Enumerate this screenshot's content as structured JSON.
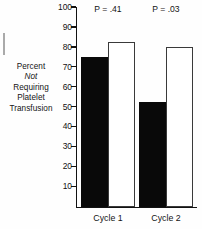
{
  "chart_data": {
    "type": "bar",
    "title": "",
    "xlabel": "",
    "ylabel": "Percent Not Requiring Platelet Transfusion",
    "ylabel_lines": [
      "Percent",
      "Not",
      "Requiring",
      "Platelet",
      "Transfusion"
    ],
    "ylabel_italic_line": "Not",
    "categories": [
      "Cycle 1",
      "Cycle 2"
    ],
    "series": [
      {
        "name": "filled",
        "values": [
          75,
          52.5
        ]
      },
      {
        "name": "open",
        "values": [
          82.5,
          80
        ]
      }
    ],
    "ylim": [
      0,
      100
    ],
    "yticks": [
      10,
      20,
      30,
      40,
      50,
      60,
      70,
      80,
      90,
      100
    ],
    "ytick_labels": [
      "10",
      "20",
      "30",
      "40",
      "50",
      "60",
      "70",
      "80",
      "90",
      "100"
    ],
    "grid": false,
    "legend": "none",
    "annotations": [
      {
        "text": "P = .41",
        "group": "Cycle 1"
      },
      {
        "text": "P = .03",
        "group": "Cycle 2"
      }
    ],
    "colors": {
      "filled_bar": "#090909",
      "open_bar_fill": "#ffffff",
      "open_bar_edge": "#3a3a3a",
      "axis": "#121212",
      "text": "#141414",
      "background": "#fefefe"
    }
  }
}
